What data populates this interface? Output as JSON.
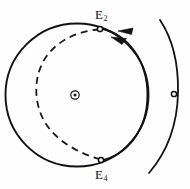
{
  "figure": {
    "type": "geometry-diagram",
    "background_color": "#fefefe",
    "stroke_color": "#111111",
    "labels": [
      {
        "id": "e2",
        "text": "E",
        "subscript": "2",
        "x": 95,
        "y": 8
      },
      {
        "id": "e4",
        "text": "E",
        "subscript": "4",
        "x": 95,
        "y": 168
      }
    ],
    "center_marker": {
      "name": "center-point",
      "symbol": "circled-dot",
      "x": 75,
      "y": 95,
      "outer_radius": 4.2,
      "inner_radius": 1.5
    },
    "curves": [
      {
        "name": "solid-circle-main",
        "style": "solid",
        "shape": "circle",
        "cx": 77,
        "cy": 95,
        "r": 72
      },
      {
        "name": "dashed-circle-inner",
        "style": "dashed",
        "shape": "circle",
        "cx": 71,
        "cy": 96,
        "r": 58,
        "dash_pattern": "7 5"
      },
      {
        "name": "solid-circle-offset",
        "style": "solid",
        "shape": "circle",
        "cx": 105,
        "cy": 95,
        "r": 72
      },
      {
        "name": "outer-arc-right",
        "style": "solid",
        "shape": "arc",
        "note": "open arc sweeping down the right margin"
      }
    ],
    "intersection_points": [
      {
        "name": "point-e2",
        "x": 100,
        "y": 29,
        "radius": 2.6
      },
      {
        "name": "point-e4",
        "x": 101,
        "y": 160,
        "radius": 2.6
      },
      {
        "name": "point-right",
        "x": 174,
        "y": 94,
        "radius": 2.6
      }
    ],
    "arrows": [
      {
        "name": "direction-arrow-outer",
        "x": 130,
        "y": 33,
        "angle": -158
      },
      {
        "name": "direction-arrow-inner",
        "x": 123,
        "y": 41,
        "angle": -152
      }
    ]
  }
}
